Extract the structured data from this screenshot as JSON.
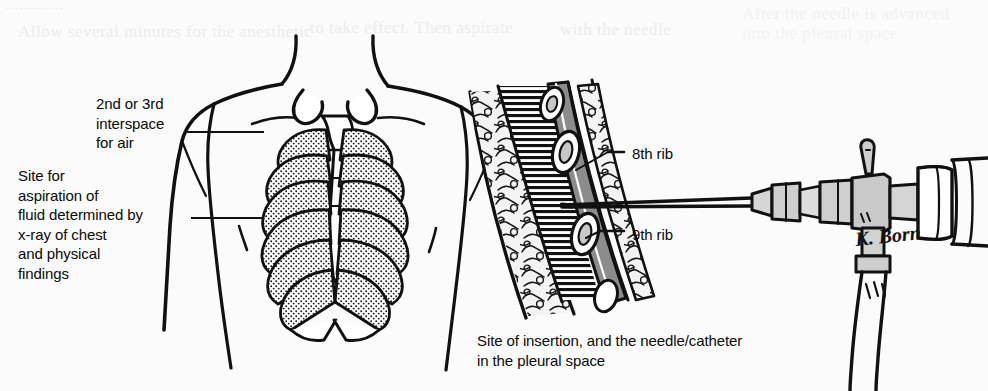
{
  "figure": {
    "domain_note": "medical line illustration — thoracentesis / pleural aspiration",
    "background_color": "#fbfbfb",
    "ink_color": "#111111",
    "ghost_text": {
      "line1": "Allow several minutes for the anesthetic",
      "line2": "to take effect. Then aspirate",
      "line3": "with the needle",
      "line4": "After the needle is advanced",
      "line5": "into the pleural space",
      "dots": "............."
    }
  },
  "labels": {
    "interspace": "2nd or 3rd\ninterspace\nfor air",
    "site_aspiration": "Site for\naspiration of\nfluid determined by\nx-ray of chest\nand physical\nfindings",
    "eighth_rib": "8th rib",
    "ninth_rib": "9th rib"
  },
  "caption": {
    "insertion": "Site of insertion, and the needle/catheter\nin the pleural space"
  },
  "signature": {
    "artist": "K. Born"
  },
  "anatomy": {
    "left_panel": [
      "anterior chest wall",
      "clavicles",
      "sternum",
      "rib cage (stippled ribs)",
      "shoulders and arms",
      "umbilicus"
    ],
    "right_panel": [
      "subcutaneous fat (cobblestone)",
      "intercostal muscle",
      "8th rib cross-section",
      "9th rib cross-section",
      "pleural space (hatched)",
      "needle / catheter",
      "three-way stopcock",
      "syringe barrel",
      "drainage tubing"
    ]
  }
}
